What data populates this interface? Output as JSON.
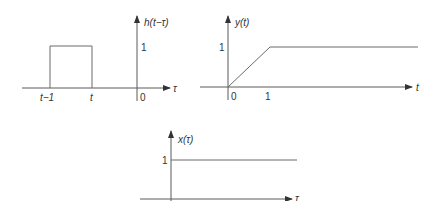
{
  "panels": {
    "h": {
      "ylabel": "h(t−τ)",
      "xlabel": "τ",
      "ytick": "1",
      "origin": "0",
      "tick_left": "t−1",
      "tick_right": "t"
    },
    "y": {
      "ylabel": "y(t)",
      "xlabel": "t",
      "ytick": "1",
      "origin": "0",
      "tick_one": "1"
    },
    "x": {
      "ylabel": "x(τ)",
      "xlabel": "τ",
      "ytick": "1"
    }
  },
  "colors": {
    "axis": "#5a5a5a",
    "signal": "#6a6a6a",
    "text": "#333333"
  }
}
